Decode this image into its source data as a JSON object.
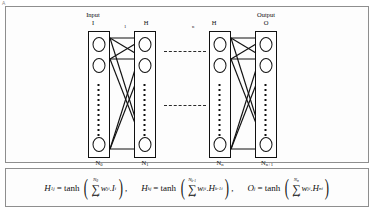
{
  "figure": {
    "panel_letter": "A",
    "diagram_title": "feedforward-neural-network-architecture"
  },
  "layers": [
    {
      "id": "input",
      "top_label_line1": "Input",
      "top_label_line2": "I",
      "bottom_label_base": "N",
      "bottom_label_sub": "0",
      "neurons_visible": 3
    },
    {
      "id": "hidden-first",
      "top_label_line1": "",
      "top_label_line2": "H",
      "top_label_sub": "1",
      "bottom_label_base": "N",
      "bottom_label_sub": "1",
      "neurons_visible": 3
    },
    {
      "id": "hidden-last",
      "top_label_line1": "",
      "top_label_line2": "H",
      "top_label_sub": "n",
      "bottom_label_base": "N",
      "bottom_label_sub": "n",
      "neurons_visible": 3
    },
    {
      "id": "output",
      "top_label_line1": "Output",
      "top_label_line2": "O",
      "bottom_label_base": "N",
      "bottom_label_sub": "n+1",
      "neurons_visible": 3
    }
  ],
  "ellipsis": {
    "upper": "dashed-line",
    "lower": "dashed-line"
  },
  "equations": {
    "eq1": {
      "lhs_base": "H",
      "lhs_sub": "1",
      "lhs_sup": "j",
      "eq_sign": "= tanh",
      "sum_upper_base": "N",
      "sum_upper_sub": "0",
      "sum_symbol": "∑",
      "sum_lower": "i=1",
      "term_w": "w",
      "term_w_sub": "ji",
      "dot": ".",
      "term_x_base": "I",
      "term_x_sup": "i"
    },
    "eq2": {
      "lhs_base": "H",
      "lhs_sub": "k",
      "lhs_sup": "j",
      "eq_sign": "= tanh",
      "sum_upper_base": "N",
      "sum_upper_sub": "k-1",
      "sum_symbol": "∑",
      "sum_lower": "i=1",
      "term_w": "w",
      "term_w_sub": "ji",
      "dot": ".",
      "term_x_base": "H",
      "term_x_sub": "k-1",
      "term_x_sup": "i"
    },
    "eq3": {
      "lhs_base": "O",
      "lhs_sup": "j",
      "eq_sign": "= tanh",
      "sum_upper_base": "N",
      "sum_upper_sub": "n",
      "sum_symbol": "∑",
      "sum_lower": "i=1",
      "term_w": "w",
      "term_w_sub": "ji",
      "dot": ".",
      "term_x_base": "H",
      "term_x_sub": "n",
      "term_x_sup": "i"
    },
    "separator": ","
  },
  "colors": {
    "stroke": "#111111",
    "panel_border": "#8e8e8e",
    "background": "#ffffff"
  }
}
